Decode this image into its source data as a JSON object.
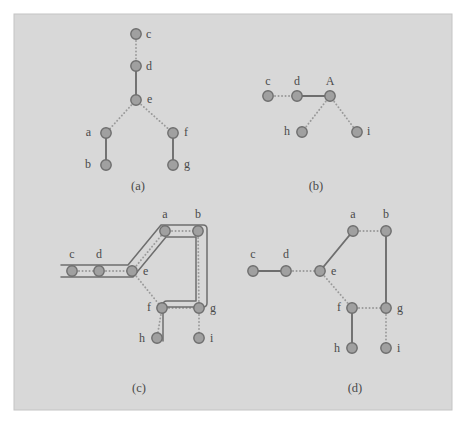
{
  "figure": {
    "canvas": {
      "width": 466,
      "height": 424,
      "background": "#ffffff"
    },
    "plate": {
      "x": 14,
      "y": 14,
      "width": 438,
      "height": 396,
      "fill": "#d8d8d8",
      "stroke": "#c4c4c4"
    },
    "style": {
      "node_fill": "#a0a0a0",
      "node_stroke": "#6e6e6e",
      "node_radius": 5.2,
      "edge_solid_color": "#6e6e6e",
      "edge_dotted_color": "#9a9a9a",
      "edge_width": 1.9,
      "tube_color": "#6e6e6e",
      "tube_width": 1.5,
      "label_color": "#4a4a4a"
    },
    "panels": [
      {
        "id": "a",
        "caption": "(a)",
        "caption_pos": {
          "x": 138,
          "y": 190
        },
        "description": "tree rooted through d-e with branches to a-b and f-g",
        "nodes": [
          {
            "id": "c",
            "label": "c",
            "x": 136,
            "y": 34,
            "label_dx": 10,
            "label_dy": 4
          },
          {
            "id": "d",
            "label": "d",
            "x": 136,
            "y": 66,
            "label_dx": 10,
            "label_dy": 4
          },
          {
            "id": "e",
            "label": "e",
            "x": 136,
            "y": 100,
            "label_dx": 11,
            "label_dy": 3
          },
          {
            "id": "a",
            "label": "a",
            "x": 106,
            "y": 133,
            "label_dx": -15,
            "label_dy": 3
          },
          {
            "id": "f",
            "label": "f",
            "x": 173,
            "y": 133,
            "label_dx": 11,
            "label_dy": 3
          },
          {
            "id": "b",
            "label": "b",
            "x": 106,
            "y": 165,
            "label_dx": -15,
            "label_dy": 3
          },
          {
            "id": "g",
            "label": "g",
            "x": 173,
            "y": 165,
            "label_dx": 11,
            "label_dy": 3
          }
        ],
        "edges": [
          {
            "from": "c",
            "to": "d",
            "style": "dotted"
          },
          {
            "from": "d",
            "to": "e",
            "style": "solid"
          },
          {
            "from": "e",
            "to": "a",
            "style": "dotted"
          },
          {
            "from": "e",
            "to": "f",
            "style": "dotted"
          },
          {
            "from": "a",
            "to": "b",
            "style": "solid"
          },
          {
            "from": "f",
            "to": "g",
            "style": "solid"
          }
        ],
        "tubes": []
      },
      {
        "id": "b",
        "caption": "(b)",
        "caption_pos": {
          "x": 316,
          "y": 190
        },
        "description": "contracted graph with merged node A",
        "nodes": [
          {
            "id": "c",
            "label": "c",
            "x": 268,
            "y": 96,
            "label_dx": 0,
            "label_dy": -11
          },
          {
            "id": "d",
            "label": "d",
            "x": 297,
            "y": 96,
            "label_dx": 0,
            "label_dy": -11
          },
          {
            "id": "A",
            "label": "A",
            "x": 330,
            "y": 96,
            "label_dx": 0,
            "label_dy": -11
          },
          {
            "id": "h",
            "label": "h",
            "x": 302,
            "y": 132,
            "label_dx": -12,
            "label_dy": 3
          },
          {
            "id": "i",
            "label": "i",
            "x": 357,
            "y": 132,
            "label_dx": 10,
            "label_dy": 3
          }
        ],
        "edges": [
          {
            "from": "c",
            "to": "d",
            "style": "dotted"
          },
          {
            "from": "d",
            "to": "A",
            "style": "solid"
          },
          {
            "from": "A",
            "to": "h",
            "style": "dotted"
          },
          {
            "from": "A",
            "to": "i",
            "style": "dotted"
          }
        ],
        "tubes": []
      },
      {
        "id": "c",
        "caption": "(c)",
        "caption_pos": {
          "x": 139,
          "y": 392
        },
        "description": "graph with highlighted tube path c-d-e-a-b-g-f-h",
        "nodes": [
          {
            "id": "c",
            "label": "c",
            "x": 72,
            "y": 271,
            "label_dx": 0,
            "label_dy": -13
          },
          {
            "id": "d",
            "label": "d",
            "x": 99,
            "y": 271,
            "label_dx": 0,
            "label_dy": -13
          },
          {
            "id": "e",
            "label": "e",
            "x": 132,
            "y": 271,
            "label_dx": 11,
            "label_dy": 4
          },
          {
            "id": "a",
            "label": "a",
            "x": 165,
            "y": 231,
            "label_dx": 0,
            "label_dy": -13
          },
          {
            "id": "b",
            "label": "b",
            "x": 198,
            "y": 231,
            "label_dx": 0,
            "label_dy": -13
          },
          {
            "id": "f",
            "label": "f",
            "x": 162,
            "y": 308,
            "label_dx": -11,
            "label_dy": 3
          },
          {
            "id": "g",
            "label": "g",
            "x": 199,
            "y": 308,
            "label_dx": 11,
            "label_dy": 4
          },
          {
            "id": "h",
            "label": "h",
            "x": 157,
            "y": 338,
            "label_dx": -12,
            "label_dy": 4
          },
          {
            "id": "i",
            "label": "i",
            "x": 199,
            "y": 338,
            "label_dx": 11,
            "label_dy": 4
          }
        ],
        "edges": [
          {
            "from": "c",
            "to": "d",
            "style": "dotted"
          },
          {
            "from": "d",
            "to": "e",
            "style": "dotted"
          },
          {
            "from": "e",
            "to": "a",
            "style": "dotted"
          },
          {
            "from": "a",
            "to": "b",
            "style": "dotted"
          },
          {
            "from": "b",
            "to": "g",
            "style": "dotted"
          },
          {
            "from": "e",
            "to": "f",
            "style": "dotted"
          },
          {
            "from": "f",
            "to": "g",
            "style": "dotted"
          },
          {
            "from": "f",
            "to": "h",
            "style": "dotted"
          },
          {
            "from": "g",
            "to": "i",
            "style": "dotted"
          }
        ],
        "tubes": [
          {
            "name": "main-tube",
            "outer": "M 61 265 L 128 265 L 161 225 L 203 225 Q 207 225 207 229 L 207 303 Q 207 307 203 307 L 162 307",
            "inner": "M 61 277 L 133 277 L 166 237 L 196 237 L 196 301 L 167 301 Q 163 301 163 305 L 163 341"
          }
        ]
      },
      {
        "id": "d",
        "caption": "(d)",
        "caption_pos": {
          "x": 355,
          "y": 392
        },
        "description": "graph with solid spanning-path edges c-d, e-a, b-g, f-h",
        "nodes": [
          {
            "id": "c",
            "label": "c",
            "x": 253,
            "y": 271,
            "label_dx": 0,
            "label_dy": -13
          },
          {
            "id": "d",
            "label": "d",
            "x": 286,
            "y": 271,
            "label_dx": 0,
            "label_dy": -13
          },
          {
            "id": "e",
            "label": "e",
            "x": 320,
            "y": 271,
            "label_dx": 11,
            "label_dy": 4
          },
          {
            "id": "a",
            "label": "a",
            "x": 353,
            "y": 231,
            "label_dx": 0,
            "label_dy": -13
          },
          {
            "id": "b",
            "label": "b",
            "x": 386,
            "y": 231,
            "label_dx": 0,
            "label_dy": -13
          },
          {
            "id": "f",
            "label": "f",
            "x": 352,
            "y": 308,
            "label_dx": -11,
            "label_dy": 3
          },
          {
            "id": "g",
            "label": "g",
            "x": 386,
            "y": 308,
            "label_dx": 11,
            "label_dy": 4
          },
          {
            "id": "h",
            "label": "h",
            "x": 352,
            "y": 348,
            "label_dx": -12,
            "label_dy": 4
          },
          {
            "id": "i",
            "label": "i",
            "x": 386,
            "y": 348,
            "label_dx": 11,
            "label_dy": 4
          }
        ],
        "edges": [
          {
            "from": "c",
            "to": "d",
            "style": "solid"
          },
          {
            "from": "d",
            "to": "e",
            "style": "dotted"
          },
          {
            "from": "e",
            "to": "a",
            "style": "solid"
          },
          {
            "from": "a",
            "to": "b",
            "style": "dotted"
          },
          {
            "from": "b",
            "to": "g",
            "style": "solid"
          },
          {
            "from": "e",
            "to": "f",
            "style": "dotted"
          },
          {
            "from": "f",
            "to": "g",
            "style": "dotted"
          },
          {
            "from": "f",
            "to": "h",
            "style": "solid"
          },
          {
            "from": "g",
            "to": "i",
            "style": "dotted"
          }
        ],
        "tubes": []
      }
    ]
  }
}
